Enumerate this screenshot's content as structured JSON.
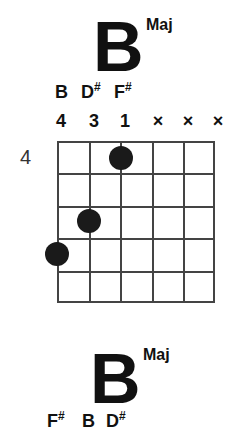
{
  "chord": {
    "root": "B",
    "quality": "Maj",
    "notes": [
      {
        "name": "B",
        "sharp": ""
      },
      {
        "name": "D",
        "sharp": "#"
      },
      {
        "name": "F",
        "sharp": "#"
      }
    ],
    "fingers": [
      "4",
      "3",
      "1",
      "×",
      "×",
      "×"
    ],
    "start_fret": "4",
    "strings": 6,
    "frets_shown": 5,
    "dots": [
      {
        "string": 3,
        "fret": 1
      },
      {
        "string": 2,
        "fret": 3
      },
      {
        "string": 1,
        "fret": 4
      }
    ]
  },
  "next_chord": {
    "root": "B",
    "quality": "Maj",
    "notes": [
      {
        "name": "F",
        "sharp": "#"
      },
      {
        "name": "B",
        "sharp": ""
      },
      {
        "name": "D",
        "sharp": "#"
      }
    ]
  }
}
